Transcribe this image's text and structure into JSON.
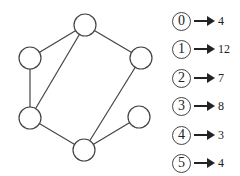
{
  "graph": {
    "nodes": [
      {
        "id": "top",
        "x": 85,
        "y": 25
      },
      {
        "id": "left-top",
        "x": 30,
        "y": 58
      },
      {
        "id": "right-top",
        "x": 141,
        "y": 58
      },
      {
        "id": "left-bottom",
        "x": 30,
        "y": 118
      },
      {
        "id": "bottom",
        "x": 84,
        "y": 150
      },
      {
        "id": "right-bottom",
        "x": 139,
        "y": 117
      }
    ],
    "edges": [
      [
        "top",
        "left-top"
      ],
      [
        "top",
        "right-top"
      ],
      [
        "top",
        "left-bottom"
      ],
      [
        "left-top",
        "left-bottom"
      ],
      [
        "left-bottom",
        "bottom"
      ],
      [
        "right-top",
        "bottom"
      ],
      [
        "bottom",
        "right-bottom"
      ]
    ]
  },
  "legend": [
    {
      "node": "0",
      "value": "4"
    },
    {
      "node": "1",
      "value": "12"
    },
    {
      "node": "2",
      "value": "7"
    },
    {
      "node": "3",
      "value": "8"
    },
    {
      "node": "4",
      "value": "3"
    },
    {
      "node": "5",
      "value": "4"
    }
  ]
}
